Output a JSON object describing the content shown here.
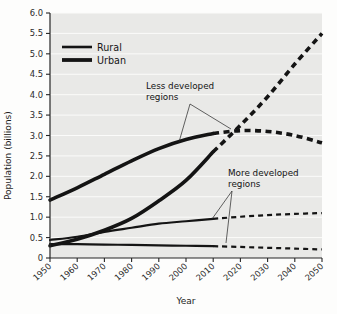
{
  "chart_data": {
    "type": "line",
    "title": "",
    "xlabel": "Year",
    "ylabel": "Population (billions)",
    "xlim": [
      1950,
      2050
    ],
    "ylim": [
      0,
      6.0
    ],
    "xticks": [
      "1950",
      "1960",
      "1970",
      "1980",
      "1990",
      "2000",
      "2010",
      "2020",
      "2030",
      "2040",
      "2050"
    ],
    "yticks": [
      "0",
      "0.5",
      "1.0",
      "1.5",
      "2.0",
      "2.5",
      "3.0",
      "3.5",
      "4.0",
      "4.5",
      "5.0",
      "5.5",
      "6.0"
    ],
    "grid": true,
    "legend_position": "top-left",
    "legend": [
      {
        "name": "Rural",
        "style": "thin-solid"
      },
      {
        "name": "Urban",
        "style": "thick-solid"
      }
    ],
    "annotations": [
      {
        "text": "Less developed regions",
        "line1": "Less developed",
        "line2": "regions"
      },
      {
        "text": "More developed regions",
        "line1": "More developed",
        "line2": "regions"
      }
    ],
    "projection_start_year": 2010,
    "note_historical_style": "solid",
    "note_projection_style": "dashed",
    "series": [
      {
        "name": "Urban - Less developed regions",
        "region": "less-developed",
        "type": "urban",
        "weight": "thick",
        "x": [
          1950,
          1960,
          1970,
          1980,
          1990,
          2000,
          2010,
          2020,
          2030,
          2040,
          2050
        ],
        "values": [
          0.3,
          0.46,
          0.68,
          0.97,
          1.4,
          1.9,
          2.6,
          3.25,
          3.95,
          4.75,
          5.5
        ]
      },
      {
        "name": "Rural - Less developed regions",
        "region": "less-developed",
        "type": "rural",
        "weight": "thick",
        "x": [
          1950,
          1960,
          1970,
          1980,
          1990,
          2000,
          2010,
          2020,
          2030,
          2040,
          2050
        ],
        "values": [
          1.42,
          1.72,
          2.05,
          2.38,
          2.68,
          2.9,
          3.05,
          3.12,
          3.1,
          3.0,
          2.82
        ]
      },
      {
        "name": "Urban - More developed regions",
        "region": "more-developed",
        "type": "urban",
        "weight": "thin",
        "x": [
          1950,
          1960,
          1970,
          1980,
          1990,
          2000,
          2010,
          2020,
          2030,
          2040,
          2050
        ],
        "values": [
          0.44,
          0.52,
          0.64,
          0.74,
          0.84,
          0.9,
          0.96,
          1.01,
          1.05,
          1.08,
          1.1
        ]
      },
      {
        "name": "Rural - More developed regions",
        "region": "more-developed",
        "type": "rural",
        "weight": "thin",
        "x": [
          1950,
          1960,
          1970,
          1980,
          1990,
          2000,
          2010,
          2020,
          2030,
          2040,
          2050
        ],
        "values": [
          0.34,
          0.34,
          0.33,
          0.32,
          0.31,
          0.3,
          0.29,
          0.27,
          0.25,
          0.23,
          0.21
        ]
      }
    ]
  }
}
